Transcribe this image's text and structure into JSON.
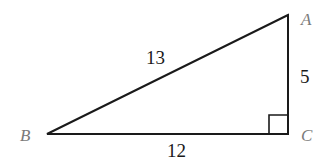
{
  "diagram": {
    "type": "right-triangle",
    "vertices": {
      "A": {
        "label": "A",
        "x": 288,
        "y": 15
      },
      "B": {
        "label": "B",
        "x": 47,
        "y": 134
      },
      "C": {
        "label": "C",
        "x": 288,
        "y": 134
      }
    },
    "sides": {
      "AB": {
        "label": "13"
      },
      "AC": {
        "label": "5"
      },
      "BC": {
        "label": "12"
      }
    },
    "right_angle_at": "C",
    "colors": {
      "line": "#1a1a1a",
      "vertex_label": "#7a7a7a",
      "side_label": "#1a1a1a"
    }
  }
}
